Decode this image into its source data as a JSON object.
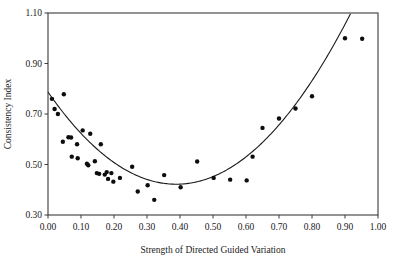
{
  "chart_data": {
    "type": "scatter",
    "title": "",
    "xlabel": "Strength of Directed Guided Variation",
    "ylabel": "Consistency Index",
    "xlim": [
      0.0,
      1.0
    ],
    "ylim": [
      0.3,
      1.1
    ],
    "xticks": [
      "0.00",
      "0.10",
      "0.20",
      "0.30",
      "0.40",
      "0.50",
      "0.60",
      "0.70",
      "0.80",
      "0.90",
      "1.00"
    ],
    "xtick_values": [
      0.0,
      0.1,
      0.2,
      0.3,
      0.4,
      0.5,
      0.6,
      0.7,
      0.8,
      0.9,
      1.0
    ],
    "yticks": [
      "0.30",
      "0.50",
      "0.70",
      "0.90",
      "1.10"
    ],
    "ytick_values": [
      0.3,
      0.5,
      0.7,
      0.9,
      1.1
    ],
    "grid": false,
    "legend": null,
    "marker": "filled-circle",
    "marker_color": "#0d0d0d",
    "points": [
      {
        "x": 0.012,
        "y": 0.76
      },
      {
        "x": 0.02,
        "y": 0.72
      },
      {
        "x": 0.03,
        "y": 0.7
      },
      {
        "x": 0.048,
        "y": 0.778
      },
      {
        "x": 0.045,
        "y": 0.59
      },
      {
        "x": 0.062,
        "y": 0.608
      },
      {
        "x": 0.07,
        "y": 0.607
      },
      {
        "x": 0.072,
        "y": 0.531
      },
      {
        "x": 0.088,
        "y": 0.58
      },
      {
        "x": 0.09,
        "y": 0.525
      },
      {
        "x": 0.105,
        "y": 0.635
      },
      {
        "x": 0.118,
        "y": 0.503
      },
      {
        "x": 0.122,
        "y": 0.497
      },
      {
        "x": 0.128,
        "y": 0.622
      },
      {
        "x": 0.142,
        "y": 0.513
      },
      {
        "x": 0.148,
        "y": 0.466
      },
      {
        "x": 0.155,
        "y": 0.463
      },
      {
        "x": 0.16,
        "y": 0.58
      },
      {
        "x": 0.172,
        "y": 0.46
      },
      {
        "x": 0.178,
        "y": 0.47
      },
      {
        "x": 0.182,
        "y": 0.443
      },
      {
        "x": 0.192,
        "y": 0.466
      },
      {
        "x": 0.198,
        "y": 0.432
      },
      {
        "x": 0.218,
        "y": 0.447
      },
      {
        "x": 0.255,
        "y": 0.491
      },
      {
        "x": 0.272,
        "y": 0.393
      },
      {
        "x": 0.302,
        "y": 0.418
      },
      {
        "x": 0.322,
        "y": 0.36
      },
      {
        "x": 0.352,
        "y": 0.458
      },
      {
        "x": 0.402,
        "y": 0.41
      },
      {
        "x": 0.452,
        "y": 0.512
      },
      {
        "x": 0.502,
        "y": 0.447
      },
      {
        "x": 0.552,
        "y": 0.44
      },
      {
        "x": 0.602,
        "y": 0.437
      },
      {
        "x": 0.62,
        "y": 0.531
      },
      {
        "x": 0.65,
        "y": 0.645
      },
      {
        "x": 0.7,
        "y": 0.682
      },
      {
        "x": 0.75,
        "y": 0.722
      },
      {
        "x": 0.8,
        "y": 0.77
      },
      {
        "x": 0.9,
        "y": 1.0
      },
      {
        "x": 0.952,
        "y": 0.998
      }
    ],
    "fit_curve": {
      "type": "quadratic",
      "description": "U-shaped least-squares fit",
      "coefficients": {
        "a": 2.42,
        "b": -1.88,
        "c": 0.787
      },
      "color": "#1a1a1a"
    }
  }
}
